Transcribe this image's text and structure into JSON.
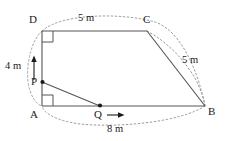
{
  "diagram": {
    "shape_type": "trapezoid",
    "stroke_color": "#555555",
    "dotted_color": "#999999",
    "text_color": "#1a1a1a",
    "vertices": [
      {
        "id": "A",
        "label": "A",
        "x": 42,
        "y": 106
      },
      {
        "id": "B",
        "label": "B",
        "x": 205,
        "y": 106
      },
      {
        "id": "C",
        "label": "C",
        "x": 147,
        "y": 31
      },
      {
        "id": "D",
        "label": "D",
        "x": 42,
        "y": 31
      }
    ],
    "points": [
      {
        "id": "P",
        "label": "P",
        "x": 42,
        "y": 82,
        "on_segment": "AD"
      },
      {
        "id": "Q",
        "label": "Q",
        "x": 100,
        "y": 106,
        "on_segment": "AB"
      }
    ],
    "segments": [
      {
        "from": "D",
        "to": "C",
        "style": "solid"
      },
      {
        "from": "D",
        "to": "A",
        "style": "solid"
      },
      {
        "from": "A",
        "to": "B",
        "style": "solid"
      },
      {
        "from": "C",
        "to": "B",
        "style": "solid"
      },
      {
        "from": "P",
        "to": "Q",
        "style": "solid"
      }
    ],
    "right_angles": [
      {
        "at": "D",
        "label": "right-angle-marker-d"
      },
      {
        "at": "A",
        "label": "right-angle-marker-a"
      }
    ],
    "dimensions": [
      {
        "id": "dc",
        "value": "5 m",
        "measures": "DC",
        "x": 78,
        "y": 14
      },
      {
        "id": "cb",
        "value": "5 m",
        "measures": "CB",
        "x": 182,
        "y": 60
      },
      {
        "id": "ab",
        "value": "8 m",
        "measures": "AB",
        "x": 107,
        "y": 123
      },
      {
        "id": "pd",
        "value": "4 m",
        "measures": "PD",
        "x": 8,
        "y": 60
      }
    ],
    "arrows": [
      {
        "id": "arrow-up-pd",
        "direction": "up",
        "from_point": "P",
        "toward": "D"
      },
      {
        "id": "arrow-right-q",
        "direction": "right",
        "from_point": "Q",
        "toward": "B"
      }
    ],
    "outline": {
      "type": "dotted-oval",
      "description": "dotted oval enclosing the trapezoid"
    }
  }
}
